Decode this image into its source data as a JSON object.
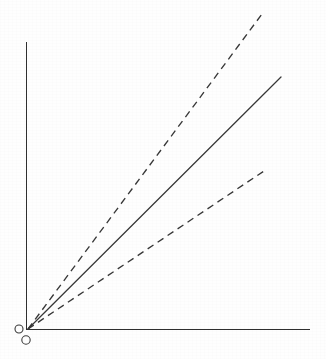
{
  "figure": {
    "title": "",
    "background_color": "#fefefe",
    "line_color": "#383838",
    "axis_color": "#2f2f2f",
    "width": 326,
    "height": 359
  },
  "chart_data": {
    "type": "line",
    "title": "",
    "subtitle": "",
    "xlabel": "",
    "ylabel": "",
    "xticklabels": [],
    "yticklabels": [],
    "grid": false,
    "legend": "none",
    "annotations": [],
    "axes": {
      "x_axis": {
        "x_start": 26,
        "x_end": 310,
        "y": 329,
        "style": "solid",
        "arrow": false
      },
      "y_axis": {
        "y_start": 42,
        "y_end": 329,
        "x": 26,
        "style": "solid",
        "arrow": false
      },
      "origin_px": [
        28,
        329
      ],
      "xlim": [
        0,
        1
      ],
      "ylim": [
        0,
        1
      ]
    },
    "series": [
      {
        "name": "upper-bound-ray",
        "style": "dashed",
        "slope_px": 1.3461,
        "x": [
          0,
          1
        ],
        "values": [
          0,
          1
        ],
        "start_px": [
          28,
          329
        ],
        "end_px": [
          262,
          14
        ]
      },
      {
        "name": "central-ray",
        "style": "solid",
        "slope_px": 0.996,
        "x": [
          0,
          1
        ],
        "values": [
          0,
          1
        ],
        "start_px": [
          28,
          329
        ],
        "end_px": [
          281,
          77
        ]
      },
      {
        "name": "lower-bound-ray",
        "style": "dashed",
        "slope_px": 0.6695,
        "x": [
          0,
          1
        ],
        "values": [
          0,
          1
        ],
        "start_px": [
          28,
          329
        ],
        "end_px": [
          267,
          169
        ]
      }
    ],
    "markers": [
      {
        "name": "origin-marker-left",
        "shape": "open-circle",
        "cx": 19,
        "cy": 329,
        "r": 4.0
      },
      {
        "name": "origin-marker-below",
        "shape": "open-circle",
        "cx": 26,
        "cy": 340,
        "r": 4.2
      }
    ]
  }
}
